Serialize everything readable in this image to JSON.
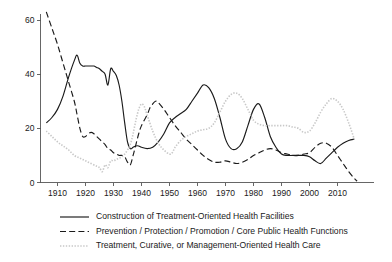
{
  "chart_data": {
    "type": "line",
    "title": "",
    "subtitle": "",
    "xlabel": "",
    "ylabel": "",
    "xlim": [
      1906,
      2017
    ],
    "ylim": [
      0,
      65
    ],
    "grid": false,
    "legend_position": "bottom",
    "y_ticks": [
      0,
      20,
      40,
      60
    ],
    "y_tick_labels": [
      "0",
      "20",
      "40",
      "60"
    ],
    "x_ticks": [
      1910,
      1920,
      1930,
      1940,
      1950,
      1960,
      1970,
      1980,
      1990,
      2000,
      2010
    ],
    "x_tick_labels": [
      "1910",
      "1920",
      "1930",
      "1940",
      "1950",
      "1960",
      "1970",
      "1980",
      "1990",
      "2000",
      "2010"
    ],
    "series": [
      {
        "name": "Construction of Treatment-Oriented Health Facilities",
        "style": "solid",
        "color": "#1a1a1a",
        "x": [
          1906,
          1908,
          1910,
          1912,
          1914,
          1916,
          1917,
          1918,
          1919,
          1920,
          1921,
          1922,
          1923,
          1924,
          1925,
          1926,
          1927,
          1928,
          1929,
          1930,
          1931,
          1932,
          1933,
          1934,
          1935,
          1936,
          1937,
          1938,
          1939,
          1940,
          1942,
          1944,
          1946,
          1948,
          1950,
          1952,
          1954,
          1956,
          1958,
          1960,
          1962,
          1964,
          1966,
          1968,
          1970,
          1972,
          1974,
          1976,
          1978,
          1980,
          1982,
          1984,
          1986,
          1988,
          1990,
          1992,
          1994,
          1996,
          1998,
          2000,
          2002,
          2004,
          2006,
          2008,
          2010,
          2012,
          2014,
          2016
        ],
        "y": [
          22,
          24,
          27,
          32,
          39,
          45,
          47,
          44,
          43,
          43,
          43,
          43,
          43,
          42.5,
          42,
          41,
          40,
          36,
          42,
          41,
          39.5,
          36,
          30,
          22,
          15,
          12.5,
          13,
          13.5,
          13.5,
          13,
          12.5,
          13,
          15,
          18,
          22,
          24,
          25.5,
          27,
          30,
          33,
          36,
          35,
          31,
          24,
          16,
          12.5,
          12.5,
          15,
          21,
          27,
          29,
          24,
          17,
          13,
          10.5,
          10,
          10,
          10,
          10,
          9.5,
          8,
          7,
          9,
          11,
          13,
          14.5,
          15.5,
          16
        ]
      },
      {
        "name": "Prevention / Protection / Promotion / Core Public Health Functions",
        "style": "dashed",
        "color": "#1a1a1a",
        "x": [
          1906,
          1908,
          1910,
          1912,
          1914,
          1916,
          1917,
          1918,
          1919,
          1920,
          1921,
          1922,
          1923,
          1924,
          1925,
          1926,
          1927,
          1928,
          1929,
          1930,
          1931,
          1932,
          1933,
          1934,
          1935,
          1936,
          1937,
          1938,
          1939,
          1940,
          1942,
          1943,
          1944,
          1945,
          1946,
          1948,
          1950,
          1952,
          1954,
          1956,
          1958,
          1960,
          1962,
          1964,
          1966,
          1968,
          1970,
          1972,
          1974,
          1976,
          1978,
          1980,
          1982,
          1984,
          1986,
          1988,
          1990,
          1992,
          1994,
          1996,
          1998,
          2000,
          2002,
          2004,
          2006,
          2008,
          2010,
          2012,
          2014,
          2016,
          2017
        ],
        "y": [
          63,
          57,
          51,
          44,
          37,
          30,
          25,
          20,
          17,
          17,
          18,
          18.5,
          18,
          17,
          16,
          15,
          14,
          12.5,
          12,
          11,
          10.5,
          10,
          10,
          9.5,
          7.5,
          6.5,
          10,
          14,
          18,
          21,
          25,
          27.5,
          29,
          30,
          29.5,
          27,
          24,
          21,
          18.5,
          16,
          14,
          12,
          10,
          8.5,
          7.5,
          7.5,
          8,
          7.5,
          7,
          7.5,
          8.5,
          10,
          11,
          12,
          12.5,
          12,
          11,
          10.5,
          10,
          10,
          10.5,
          11,
          13,
          14.5,
          14.5,
          13,
          10,
          7,
          4,
          1.5,
          0.5
        ]
      },
      {
        "name": "Treatment, Curative, or Management-Oriented Health Care",
        "style": "dotted",
        "color": "#c8c8c8",
        "x": [
          1906,
          1908,
          1910,
          1912,
          1914,
          1916,
          1918,
          1920,
          1922,
          1924,
          1925,
          1926,
          1927,
          1928,
          1929,
          1930,
          1931,
          1932,
          1933,
          1934,
          1935,
          1936,
          1937,
          1938,
          1939,
          1940,
          1941,
          1942,
          1944,
          1946,
          1948,
          1950,
          1951,
          1952,
          1954,
          1956,
          1958,
          1960,
          1962,
          1964,
          1966,
          1968,
          1970,
          1972,
          1974,
          1976,
          1978,
          1980,
          1982,
          1984,
          1986,
          1988,
          1990,
          1992,
          1994,
          1996,
          1998,
          2000,
          2002,
          2004,
          2006,
          2008,
          2010,
          2012,
          2014,
          2016
        ],
        "y": [
          19,
          17,
          15,
          13.5,
          12,
          10,
          9,
          8,
          7,
          6,
          5.5,
          4,
          6.5,
          5.5,
          8,
          8,
          8.5,
          9,
          9.5,
          10.5,
          12,
          14,
          18,
          23,
          27,
          29,
          28,
          25,
          19,
          14.5,
          12,
          10.5,
          11,
          13,
          15.5,
          17,
          18,
          19,
          19.5,
          20,
          22,
          26,
          30,
          32.5,
          33,
          31,
          27,
          23,
          21.5,
          21,
          21,
          21,
          21,
          21,
          20.5,
          20,
          18.5,
          19,
          22,
          26,
          29,
          31,
          30,
          27,
          22,
          16
        ]
      }
    ]
  },
  "legend": {
    "items": [
      {
        "label": "Construction of Treatment-Oriented Health Facilities",
        "style": "solid",
        "color": "#1a1a1a"
      },
      {
        "label": "Prevention / Protection / Promotion / Core Public Health Functions",
        "style": "dashed",
        "color": "#1a1a1a"
      },
      {
        "label": "Treatment, Curative, or Management-Oriented Health Care",
        "style": "dotted",
        "color": "#c8c8c8"
      }
    ]
  },
  "axes": {
    "axis_color": "#555555",
    "label_color": "#1a1a1a"
  }
}
